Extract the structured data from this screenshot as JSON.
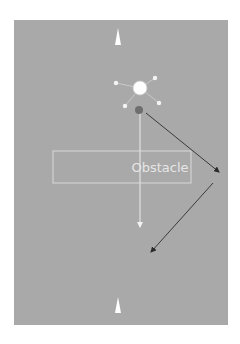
{
  "diagram": {
    "background_color": "#a9a9a9",
    "obstacle": {
      "label": "Obstacle",
      "border_color": "#dcdcdc",
      "text_color": "#e6e6e6"
    },
    "colors": {
      "arrow_dark": "#3a3a3a",
      "marker_white": "#ffffff",
      "agent_dot": "#6e6e6e",
      "straight_path": "#eeeeee"
    },
    "elements": [
      {
        "id": "top-marker",
        "type": "triangle",
        "description": "white triangle marker at top"
      },
      {
        "id": "sensor-hub",
        "type": "circle",
        "description": "white circle with four small satellite dots"
      },
      {
        "id": "agent",
        "type": "circle",
        "description": "dark gray dot below hub"
      },
      {
        "id": "direct-path",
        "type": "arrow",
        "description": "thin white vertical arrow passing through obstacle"
      },
      {
        "id": "detour-path",
        "type": "arrow",
        "description": "dark two-segment arrow going around the obstacle to the right"
      },
      {
        "id": "bottom-marker",
        "type": "triangle",
        "description": "white triangle marker at bottom"
      }
    ]
  }
}
